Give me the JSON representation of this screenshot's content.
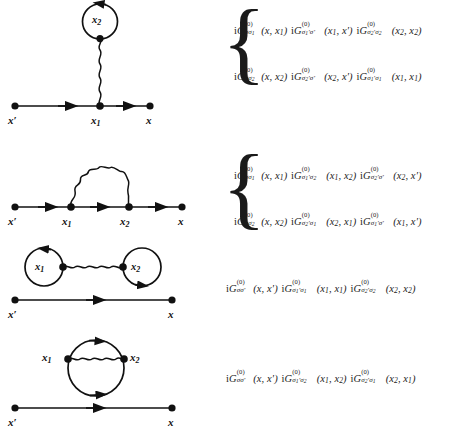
{
  "figure": {
    "type": "feynman-diagram-set",
    "ink_color": "#111111",
    "background_color": "#ffffff"
  },
  "diagrams": [
    {
      "id": "diagram-1",
      "name": "tadpole-diagram",
      "endpoints": [
        "x'",
        "x"
      ],
      "vertices": [
        "x_1",
        "x_2"
      ],
      "labels": {
        "left_end": "x′",
        "right_end": "x",
        "vertex_1": "x",
        "vertex_1_sub": "1",
        "loop": "x",
        "loop_sub": "2"
      },
      "features": [
        "fermion-line",
        "wavy-interaction-line",
        "closed-fermion-loop"
      ]
    },
    {
      "id": "diagram-2",
      "name": "self-energy-rainbow-diagram",
      "endpoints": [
        "x'",
        "x"
      ],
      "vertices": [
        "x_1",
        "x_2"
      ],
      "labels": {
        "left_end": "x′",
        "right_end": "x",
        "vertex_1": "x",
        "vertex_1_sub": "1",
        "vertex_2": "x",
        "vertex_2_sub": "2"
      },
      "features": [
        "fermion-line",
        "wavy-arc-interaction-line"
      ]
    },
    {
      "id": "diagram-3",
      "name": "disconnected-double-tadpole-diagram",
      "endpoints": [
        "x'",
        "x"
      ],
      "vertices": [
        "x_1",
        "x_2"
      ],
      "labels": {
        "left_end": "x′",
        "right_end": "x",
        "loop_1": "x",
        "loop_1_sub": "1",
        "loop_2": "x",
        "loop_2_sub": "2"
      },
      "features": [
        "free-fermion-line",
        "two-closed-loops",
        "horizontal-wavy-line"
      ]
    },
    {
      "id": "diagram-4",
      "name": "disconnected-bubble-diagram",
      "endpoints": [
        "x'",
        "x"
      ],
      "vertices": [
        "x_1",
        "x_2"
      ],
      "labels": {
        "left_end": "x′",
        "right_end": "x",
        "vertex_1": "x",
        "vertex_1_sub": "1",
        "vertex_2": "x",
        "vertex_2_sub": "2"
      },
      "features": [
        "free-fermion-line",
        "closed-bubble-loop",
        "wavy-interaction-line"
      ]
    }
  ],
  "equations": {
    "group_1": {
      "brace": "{",
      "lines": [
        {
          "id": "eq-1a",
          "terms": [
            {
              "i": "i",
              "G": "G",
              "sup": "(0)",
              "sub_a": "σ",
              "sub_a_d": "",
              "sub_b": "σ",
              "sub_b_d": "1",
              "sub_b_prime": false,
              "sub_a_prime": false,
              "args": "(x, x₁)"
            },
            {
              "i": "i",
              "G": "G",
              "sup": "(0)",
              "sub_a": "σ",
              "sub_a_d": "1",
              "sub_a_prime": true,
              "sub_b": "σ",
              "sub_b_d": "",
              "sub_b_prime": true,
              "args": "(x₁, x′)"
            },
            {
              "i": "i",
              "G": "G",
              "sup": "(0)",
              "sub_a": "σ",
              "sub_a_d": "2",
              "sub_a_prime": true,
              "sub_b": "σ",
              "sub_b_d": "2",
              "sub_b_prime": false,
              "args": "(x₂, x₂)"
            }
          ]
        },
        {
          "id": "eq-1b",
          "terms": [
            {
              "i": "i",
              "G": "G",
              "sup": "(0)",
              "sub_a": "σ",
              "sub_a_d": "",
              "sub_a_prime": false,
              "sub_b": "σ",
              "sub_b_d": "2",
              "sub_b_prime": false,
              "args": "(x, x₂)"
            },
            {
              "i": "i",
              "G": "G",
              "sup": "(0)",
              "sub_a": "σ",
              "sub_a_d": "2",
              "sub_a_prime": true,
              "sub_b": "σ",
              "sub_b_d": "",
              "sub_b_prime": true,
              "args": "(x₂, x′)"
            },
            {
              "i": "i",
              "G": "G",
              "sup": "(0)",
              "sub_a": "σ",
              "sub_a_d": "1",
              "sub_a_prime": true,
              "sub_b": "σ",
              "sub_b_d": "1",
              "sub_b_prime": false,
              "args": "(x₁, x₁)"
            }
          ]
        }
      ]
    },
    "group_2": {
      "brace": "{",
      "lines": [
        {
          "id": "eq-2a",
          "terms": [
            {
              "i": "i",
              "G": "G",
              "sup": "(0)",
              "sub_a": "σ",
              "sub_a_d": "",
              "sub_a_prime": false,
              "sub_b": "σ",
              "sub_b_d": "1",
              "sub_b_prime": false,
              "args": "(x, x₁)"
            },
            {
              "i": "i",
              "G": "G",
              "sup": "(0)",
              "sub_a": "σ",
              "sub_a_d": "1",
              "sub_a_prime": true,
              "sub_b": "σ",
              "sub_b_d": "2",
              "sub_b_prime": false,
              "args": "(x₁, x₂)"
            },
            {
              "i": "i",
              "G": "G",
              "sup": "(0)",
              "sub_a": "σ",
              "sub_a_d": "2",
              "sub_a_prime": true,
              "sub_b": "σ",
              "sub_b_d": "",
              "sub_b_prime": true,
              "args": "(x₂, x′)"
            }
          ]
        },
        {
          "id": "eq-2b",
          "terms": [
            {
              "i": "i",
              "G": "G",
              "sup": "(0)",
              "sub_a": "σ",
              "sub_a_d": "",
              "sub_a_prime": false,
              "sub_b": "σ",
              "sub_b_d": "2",
              "sub_b_prime": false,
              "args": "(x, x₂)"
            },
            {
              "i": "i",
              "G": "G",
              "sup": "(0)",
              "sub_a": "σ",
              "sub_a_d": "2",
              "sub_a_prime": true,
              "sub_b": "σ",
              "sub_b_d": "1",
              "sub_b_prime": false,
              "args": "(x₂, x₁)"
            },
            {
              "i": "i",
              "G": "G",
              "sup": "(0)",
              "sub_a": "σ",
              "sub_a_d": "1",
              "sub_a_prime": true,
              "sub_b": "σ",
              "sub_b_d": "",
              "sub_b_prime": true,
              "args": "(x₁, x′)"
            }
          ]
        }
      ]
    },
    "group_3": {
      "brace": "",
      "lines": [
        {
          "id": "eq-3",
          "terms": [
            {
              "i": "i",
              "G": "G",
              "sup": "(0)",
              "sub_a": "σ",
              "sub_a_d": "",
              "sub_a_prime": false,
              "sub_b": "σ",
              "sub_b_d": "",
              "sub_b_prime": true,
              "args": "(x, x′)"
            },
            {
              "i": "i",
              "G": "G",
              "sup": "(0)",
              "sub_a": "σ",
              "sub_a_d": "1",
              "sub_a_prime": true,
              "sub_b": "σ",
              "sub_b_d": "1",
              "sub_b_prime": false,
              "args": "(x₁, x₁)"
            },
            {
              "i": "i",
              "G": "G",
              "sup": "(0)",
              "sub_a": "σ",
              "sub_a_d": "2",
              "sub_a_prime": true,
              "sub_b": "σ",
              "sub_b_d": "2",
              "sub_b_prime": false,
              "args": "(x₂, x₂)"
            }
          ]
        }
      ]
    },
    "group_4": {
      "brace": "",
      "lines": [
        {
          "id": "eq-4",
          "terms": [
            {
              "i": "i",
              "G": "G",
              "sup": "(0)",
              "sub_a": "σ",
              "sub_a_d": "",
              "sub_a_prime": false,
              "sub_b": "σ",
              "sub_b_d": "",
              "sub_b_prime": true,
              "args": "(x, x′)"
            },
            {
              "i": "i",
              "G": "G",
              "sup": "(0)",
              "sub_a": "σ",
              "sub_a_d": "1",
              "sub_a_prime": true,
              "sub_b": "σ",
              "sub_b_d": "2",
              "sub_b_prime": false,
              "args": "(x₁, x₂)"
            },
            {
              "i": "i",
              "G": "G",
              "sup": "(0)",
              "sub_a": "σ",
              "sub_a_d": "2",
              "sub_a_prime": true,
              "sub_b": "σ",
              "sub_b_d": "1",
              "sub_b_prime": false,
              "args": "(x₂, x₁)"
            }
          ]
        }
      ]
    }
  },
  "glyphs": {
    "x": "x",
    "x_prime": "x′",
    "sub_1": "1",
    "sub_2": "2",
    "sigma": "σ",
    "sigma_prime": "σ′",
    "superscript_zero": "(0)",
    "brace_left": "{",
    "imaginary_unit": "i",
    "G_symbol": "G"
  }
}
